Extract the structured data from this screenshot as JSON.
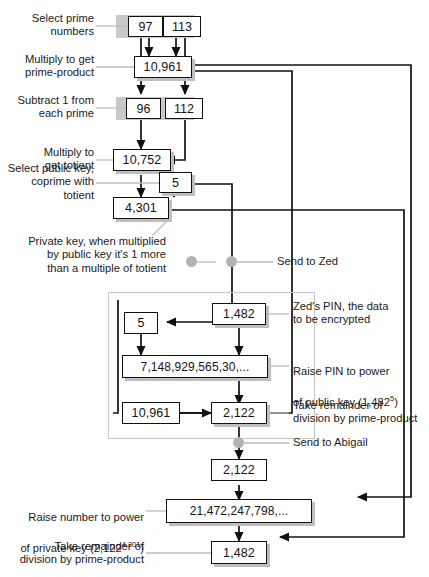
{
  "diagram": {
    "accent_grey": "#c9c9c9",
    "line_color": "#111111",
    "leader_color": "#b5b5b5"
  },
  "nodes": {
    "prime_a": "97",
    "prime_b": "113",
    "prime_product": "10,961",
    "prime_a_minus1": "96",
    "prime_b_minus1": "112",
    "totient": "10,752",
    "public_key": "5",
    "private_key": "4,301",
    "public_key_zed": "5",
    "pin": "1,482",
    "pin_powered": "7,148,929,565,30,...",
    "prime_product_zed": "10,961",
    "cipher": "2,122",
    "cipher_received": "2,122",
    "cipher_powered": "21,472,247,798,...",
    "decrypted_pin": "1,482"
  },
  "captions": {
    "select_primes": "Select prime\nnumbers",
    "multiply_primes": "Multiply to get\nprime-product",
    "subtract_one": "Subtract 1 from\neach prime",
    "multiply_totient": "Multiply to\nget totient",
    "select_public_key": "Select public key,\ncoprime with\ntotient",
    "private_key_note": "Private key, when multiplied\nby public key it's 1 more\nthan a multiple of totient",
    "send_to_zed": "Send to Zed",
    "zed_pin": "Zed's PIN, the data\nto be encrypted",
    "raise_pin_line1": "Raise PIN to power",
    "raise_pin_line2_pre": "of public key (1,482",
    "raise_pin_line2_sup": "5",
    "raise_pin_line2_post": ")",
    "take_remainder_enc": "Take remainder of\ndivision by prime-product",
    "send_to_abigail": "Send to Abigail",
    "raise_private_line1": "Raise number to power",
    "raise_private_line2_pre": "of private key (2,122",
    "raise_private_line2_sup": "4,301",
    "raise_private_line2_post": ")",
    "take_remainder_dec": "Take remainder of\ndivision by prime-product"
  }
}
